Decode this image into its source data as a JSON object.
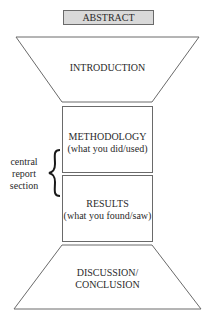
{
  "diagram": {
    "abstract": {
      "label": "ABSTRACT",
      "fill": "#d9d9d9"
    },
    "introduction": {
      "label": "INTRODUCTION"
    },
    "methodology": {
      "label": "METHODOLOGY",
      "sublabel": "(what you did/used)"
    },
    "results": {
      "label": "RESULTS",
      "sublabel": "(what you found/saw)"
    },
    "discussion": {
      "line1": "DISCUSSION/",
      "line2": "CONCLUSION"
    },
    "bracket": {
      "line1": "central",
      "line2": "report",
      "line3": "section"
    },
    "stroke_color": "#6a6a6a"
  }
}
